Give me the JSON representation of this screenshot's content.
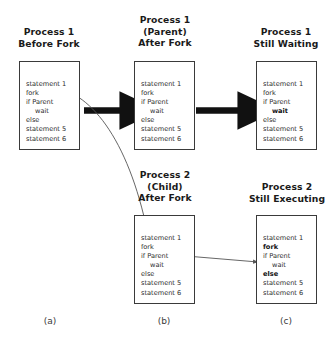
{
  "figure": {
    "background_color": "#ffffff",
    "line_color": "#3a3a3a",
    "thick_arrow_color": "#111111",
    "thin_arrow_color": "#555555",
    "text_color": "#2b2b2b"
  },
  "code_listing": {
    "lines": [
      "statement 1",
      "fork",
      "if Parent",
      "wait",
      "else",
      "statement 5",
      "statement 6"
    ]
  },
  "boxes": [
    {
      "id": "process1-before-fork",
      "caption": [
        "Process 1",
        "Before Fork"
      ],
      "lines": [
        {
          "text": "statement 1",
          "indent": false,
          "bold": false
        },
        {
          "text": "fork",
          "indent": false,
          "bold": false
        },
        {
          "text": "if Parent",
          "indent": false,
          "bold": false
        },
        {
          "text": "wait",
          "indent": true,
          "bold": false
        },
        {
          "text": "else",
          "indent": false,
          "bold": false
        },
        {
          "text": "statement 5",
          "indent": false,
          "bold": false
        },
        {
          "text": "statement 6",
          "indent": false,
          "bold": false
        }
      ]
    },
    {
      "id": "process1-parent-after-fork",
      "caption": [
        "Process 1",
        "(Parent)",
        "After Fork"
      ],
      "lines": [
        {
          "text": "statement 1",
          "indent": false,
          "bold": false
        },
        {
          "text": "fork",
          "indent": false,
          "bold": false
        },
        {
          "text": "if Parent",
          "indent": false,
          "bold": false
        },
        {
          "text": "wait",
          "indent": true,
          "bold": false
        },
        {
          "text": "else",
          "indent": false,
          "bold": false
        },
        {
          "text": "statement 5",
          "indent": false,
          "bold": false
        },
        {
          "text": "statement 6",
          "indent": false,
          "bold": false
        }
      ]
    },
    {
      "id": "process1-still-waiting",
      "caption": [
        "Process 1",
        "Still Waiting"
      ],
      "lines": [
        {
          "text": "statement 1",
          "indent": false,
          "bold": false
        },
        {
          "text": "fork",
          "indent": false,
          "bold": false
        },
        {
          "text": "if Parent",
          "indent": false,
          "bold": false
        },
        {
          "text": "wait",
          "indent": true,
          "bold": true
        },
        {
          "text": "else",
          "indent": false,
          "bold": false
        },
        {
          "text": "statement 5",
          "indent": false,
          "bold": false
        },
        {
          "text": "statement 6",
          "indent": false,
          "bold": false
        }
      ]
    },
    {
      "id": "process2-child-after-fork",
      "caption": [
        "Process 2",
        "(Child)",
        "After Fork"
      ],
      "lines": [
        {
          "text": "statement 1",
          "indent": false,
          "bold": false
        },
        {
          "text": "fork",
          "indent": false,
          "bold": false
        },
        {
          "text": "if Parent",
          "indent": false,
          "bold": false
        },
        {
          "text": "wait",
          "indent": true,
          "bold": false
        },
        {
          "text": "else",
          "indent": false,
          "bold": false
        },
        {
          "text": "statement 5",
          "indent": false,
          "bold": false
        },
        {
          "text": "statement 6",
          "indent": false,
          "bold": false
        }
      ]
    },
    {
      "id": "process2-still-executing",
      "caption": [
        "Process 2",
        "Still Executing"
      ],
      "lines": [
        {
          "text": "statement 1",
          "indent": false,
          "bold": false
        },
        {
          "text": "fork",
          "indent": false,
          "bold": true
        },
        {
          "text": "if Parent",
          "indent": false,
          "bold": false
        },
        {
          "text": "wait",
          "indent": true,
          "bold": false
        },
        {
          "text": "else",
          "indent": false,
          "bold": true
        },
        {
          "text": "statement 5",
          "indent": false,
          "bold": false
        },
        {
          "text": "statement 6",
          "indent": false,
          "bold": false
        }
      ]
    }
  ],
  "panel_labels": [
    {
      "id": "panel-a",
      "text": "(a)"
    },
    {
      "id": "panel-b",
      "text": "(b)"
    },
    {
      "id": "panel-c",
      "text": "(c)"
    }
  ],
  "connectors": [
    {
      "id": "parent-flow-a-to-b",
      "style": "thick-straight",
      "from": "process1-before-fork",
      "to": "process1-parent-after-fork"
    },
    {
      "id": "parent-flow-b-to-c",
      "style": "thick-straight",
      "from": "process1-parent-after-fork",
      "to": "process1-still-waiting"
    },
    {
      "id": "child-fork-curve",
      "style": "thin-curved",
      "from": "process1-before-fork",
      "to": "process2-child-after-fork"
    },
    {
      "id": "child-flow-b-to-c",
      "style": "thin-straight",
      "from": "process2-child-after-fork",
      "to": "process2-still-executing"
    }
  ]
}
